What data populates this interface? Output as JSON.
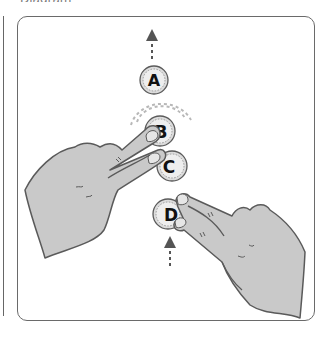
{
  "caption_partial": "Diagram",
  "figure": {
    "coins": [
      {
        "label": "A",
        "cx": 154,
        "cy": 80,
        "r": 14
      },
      {
        "label": "B",
        "cx": 160,
        "cy": 131,
        "r": 15
      },
      {
        "label": "C",
        "cx": 172,
        "cy": 166,
        "r": 15
      },
      {
        "label": "D",
        "cx": 168,
        "cy": 214,
        "r": 15
      }
    ],
    "arrows": [
      {
        "name": "arrow-up-from-A",
        "direction": "up"
      },
      {
        "name": "arrow-up-into-D",
        "direction": "up"
      }
    ],
    "colors": {
      "outline": "#5a5a5a",
      "skin": "#c9c9c9",
      "coin_fill": "#dcdcdc",
      "coin_inner": "#eeeeee",
      "nail": "#e6e6e6",
      "motion_lines": "#b8b8b8"
    }
  }
}
